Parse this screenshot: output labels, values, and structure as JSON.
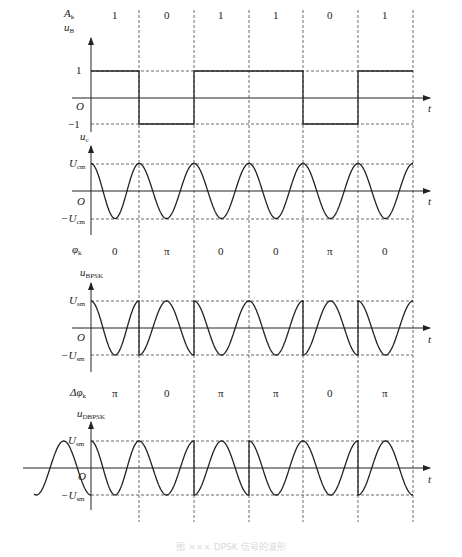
{
  "figure": {
    "caption": "图 ××× DPSK 信号的波形",
    "symbol_boundaries_x": [
      139,
      194,
      249,
      303,
      358,
      413
    ],
    "symbol_centers_x": [
      115,
      167,
      221,
      276,
      330,
      385
    ],
    "colors": {
      "line": "#222222",
      "dash": "#444444",
      "background": "#ffffff"
    }
  },
  "rows": {
    "data_bits": {
      "label": "A",
      "label_sub": "k",
      "values": [
        "1",
        "0",
        "1",
        "1",
        "0",
        "1"
      ]
    },
    "baseband": {
      "ylabel": "u",
      "ylabel_sub": "B",
      "levels": [
        "1",
        "O",
        "−1"
      ],
      "xlabel": "t"
    },
    "carrier": {
      "ylabel": "u",
      "ylabel_sub": "c",
      "levels": [
        "U",
        "O",
        "−U"
      ],
      "level_sub": "cm",
      "xlabel": "t"
    },
    "phase": {
      "label": "φ",
      "label_sub": "k",
      "values": [
        "0",
        "π",
        "0",
        "0",
        "π",
        "0"
      ]
    },
    "bpsk": {
      "ylabel": "u",
      "ylabel_sub": "BPSK",
      "levels": [
        "U",
        "O",
        "−U"
      ],
      "level_sub": "sm",
      "xlabel": "t"
    },
    "delta_phase": {
      "label": "Δφ",
      "label_sub": "k",
      "values": [
        "π",
        "0",
        "π",
        "π",
        "0",
        "π"
      ]
    },
    "dbpsk": {
      "ylabel": "u",
      "ylabel_sub": "DBPSK",
      "levels": [
        "U",
        "O",
        "−U"
      ],
      "level_sub": "sm",
      "xlabel": "t"
    }
  },
  "chart_data": {
    "type": "line",
    "symbols": [
      "1",
      "0",
      "1",
      "1",
      "0",
      "1"
    ],
    "series": [
      {
        "name": "u_B (baseband)",
        "values": [
          1,
          -1,
          1,
          1,
          -1,
          1
        ]
      },
      {
        "name": "u_c (carrier)",
        "description": "cosine, one period per symbol, amplitude U_cm"
      },
      {
        "name": "phi_k",
        "values": [
          "0",
          "π",
          "0",
          "0",
          "π",
          "0"
        ]
      },
      {
        "name": "u_BPSK",
        "description": "carrier phase = phi_k, amplitude U_sm"
      },
      {
        "name": "delta_phi_k",
        "values": [
          "π",
          "0",
          "π",
          "π",
          "0",
          "π"
        ]
      },
      {
        "name": "u_DBPSK",
        "description": "phase shift Δφ_k relative to previous symbol, amplitude U_sm; includes reference symbol before t=0"
      }
    ],
    "xlabel": "t",
    "ylim": [
      -1,
      1
    ]
  }
}
